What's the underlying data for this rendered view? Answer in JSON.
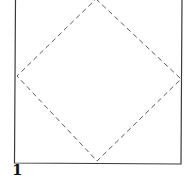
{
  "diagram": {
    "step_number": "1",
    "square": {
      "left": 15,
      "top": -2,
      "right": 181,
      "bottom": 163,
      "stroke": "#3a3a3a"
    },
    "diamond": {
      "points": [
        [
          96,
          -1
        ],
        [
          181,
          79
        ],
        [
          97,
          161
        ],
        [
          17,
          76
        ]
      ],
      "stroke": "#5a5a5a",
      "style": "dashed"
    }
  }
}
